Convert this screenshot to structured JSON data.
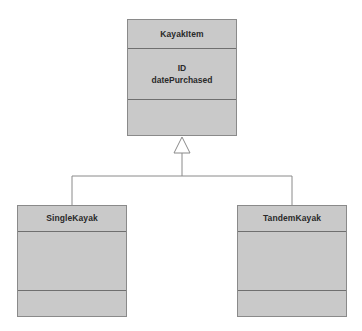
{
  "diagram": {
    "type": "uml-class-diagram",
    "title": "",
    "background_color": "#ffffff",
    "node_fill_color": "#c9c9c9",
    "node_border_color": "#8a8a8a",
    "separator_color": "#6f6f6f",
    "edge_color": "#8a8a8a",
    "arrowhead": "hollow-triangle-generalization",
    "classes": [
      {
        "id": "kayakitem",
        "name": "KayakItem",
        "role": "superclass",
        "attributes": [
          "ID",
          "datePurchased"
        ],
        "operations": []
      },
      {
        "id": "singlekayak",
        "name": "SingleKayak",
        "role": "subclass",
        "attributes": [],
        "operations": []
      },
      {
        "id": "tandemkayak",
        "name": "TandemKayak",
        "role": "subclass",
        "attributes": [],
        "operations": []
      }
    ],
    "relationships": [
      {
        "kind": "generalization",
        "from": "SingleKayak",
        "to": "KayakItem"
      },
      {
        "kind": "generalization",
        "from": "TandemKayak",
        "to": "KayakItem"
      }
    ]
  }
}
